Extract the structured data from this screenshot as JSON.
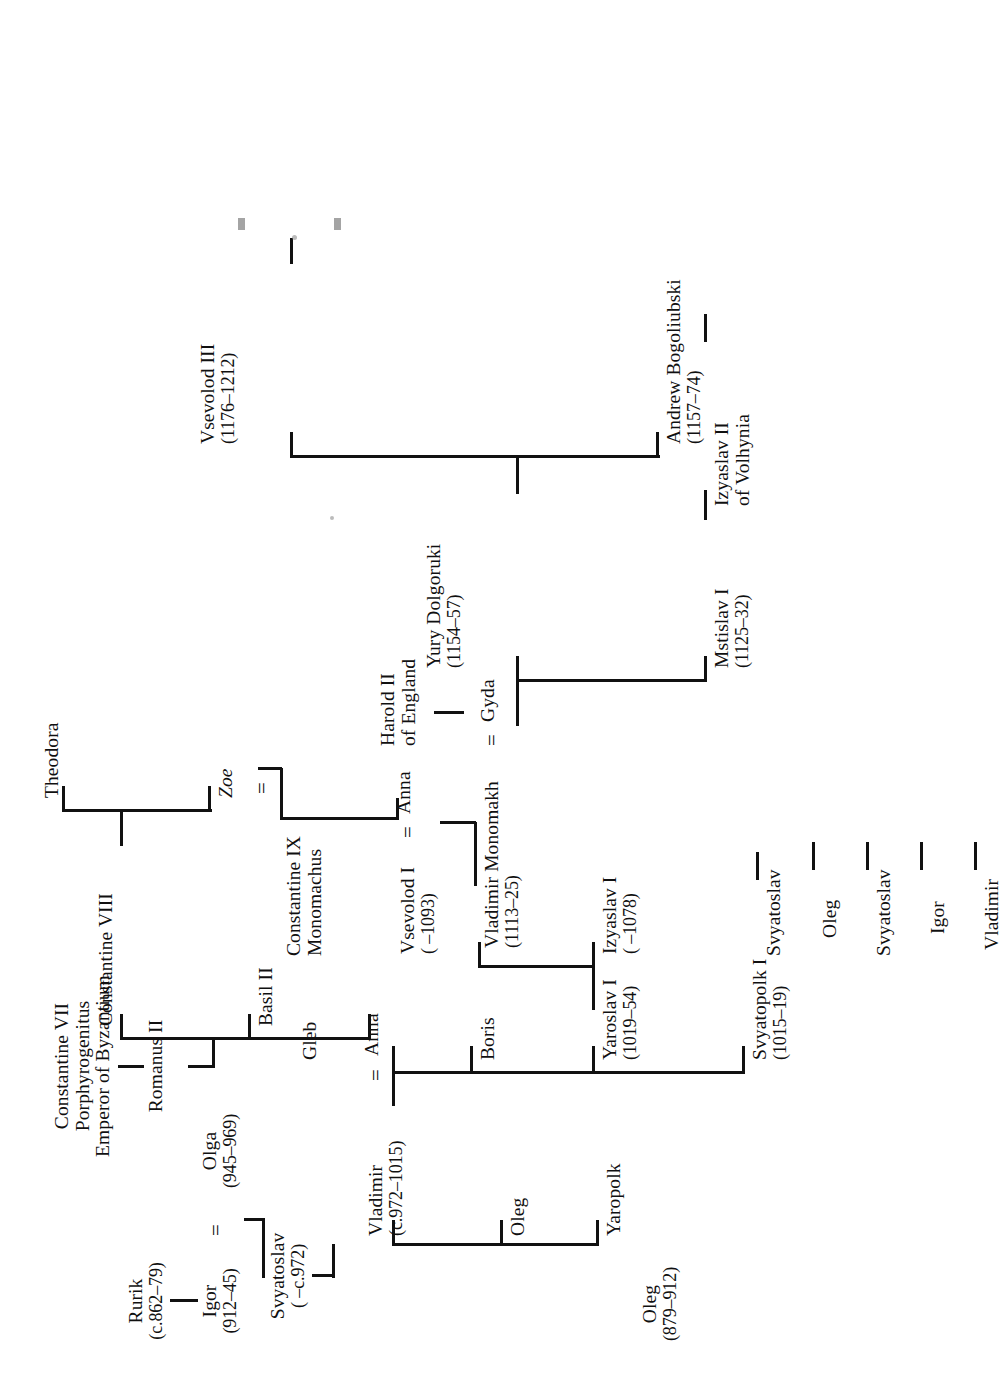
{
  "document": {
    "kind": "genealogical-chart",
    "subject": "Rurikid dynasty and Byzantine imperial connections",
    "orientation": "page rotated 90 degrees counter-clockwise"
  },
  "nodes": {
    "oleg_regent": {
      "name": "Oleg",
      "dates": "(879–912)"
    },
    "rurik": {
      "name": "Rurik",
      "dates": "(c.862–79)"
    },
    "igor": {
      "name": "Igor",
      "dates": "(912–45)"
    },
    "olga": {
      "name": "Olga",
      "dates": "(945–969)"
    },
    "svyatoslav": {
      "name": "Svyatoslav",
      "dates": "(    –c.972)"
    },
    "yaropolk": {
      "name": "Yaropolk",
      "dates": ""
    },
    "oleg_son": {
      "name": "Oleg",
      "dates": ""
    },
    "vladimir_i": {
      "name": "Vladimir",
      "dates": "(c.972–1015)"
    },
    "anna_byz": {
      "name": "Anna",
      "dates": ""
    },
    "svyatopolk_i": {
      "name": "Svyatopolk I",
      "dates": "(1015–19)"
    },
    "yaroslav_i": {
      "name": "Yaroslav I",
      "dates": "(1019–54)"
    },
    "boris": {
      "name": "Boris",
      "dates": ""
    },
    "gleb": {
      "name": "Gleb",
      "dates": ""
    },
    "izyaslav_i": {
      "name": "Izyaslav I",
      "dates": "(    –1078)"
    },
    "vsevolod_i": {
      "name": "Vsevolod I",
      "dates": "(    –1093)"
    },
    "anna_monomakh": {
      "name": "Anna",
      "dates": ""
    },
    "vladimir_monomakh": {
      "name": "Vladimir Monomakh",
      "dates": "(1113–25)"
    },
    "gyda": {
      "name": "Gyda",
      "dates": ""
    },
    "mstislav_i": {
      "name": "Mstislav I",
      "dates": "(1125–32)"
    },
    "yury_dolgoruki": {
      "name": "Yury Dolgoruki",
      "dates": "(1154–57)"
    },
    "izyaslav_ii": {
      "name": "Izyaslav II",
      "dates": "of Volhynia"
    },
    "andrew_bogoliubski": {
      "name": "Andrew Bogoliubski",
      "dates": "(1157–74)"
    },
    "vsevolod_iii": {
      "name": "Vsevolod III",
      "dates": "(1176–1212)"
    },
    "svyatoslav_b": {
      "name": "Svyatoslav",
      "dates": ""
    },
    "oleg_b": {
      "name": "Oleg",
      "dates": ""
    },
    "svyatoslav_c": {
      "name": "Svyatoslav",
      "dates": ""
    },
    "igor_b": {
      "name": "Igor",
      "dates": ""
    },
    "vladimir_b": {
      "name": "Vladimir",
      "dates": ""
    },
    "constantine_vii": {
      "name": "Constantine VII",
      "dates": ""
    },
    "porphyrogenitus": {
      "name": "Porphyrogenitus",
      "dates": ""
    },
    "emperor_byzantium": {
      "name": "Emperor of Byzantium",
      "dates": ""
    },
    "romanus_ii": {
      "name": "Romanus II",
      "dates": ""
    },
    "basil_ii": {
      "name": "Basil II",
      "dates": ""
    },
    "constantine_viii": {
      "name": "Constantine VIII",
      "dates": ""
    },
    "zoe": {
      "name": "Zoe",
      "dates": ""
    },
    "theodora": {
      "name": "Theodora",
      "dates": ""
    },
    "constantine_ix": {
      "name": "Constantine IX",
      "dates": ""
    },
    "monomachus": {
      "name": "Monomachus",
      "dates": ""
    },
    "harold_ii": {
      "name": "Harold II",
      "dates": ""
    },
    "of_england": {
      "name": "of England",
      "dates": ""
    }
  },
  "marriage_symbol": "=",
  "colors": {
    "ink": "#101010",
    "rule": "#111111",
    "paper": "#ffffff"
  }
}
